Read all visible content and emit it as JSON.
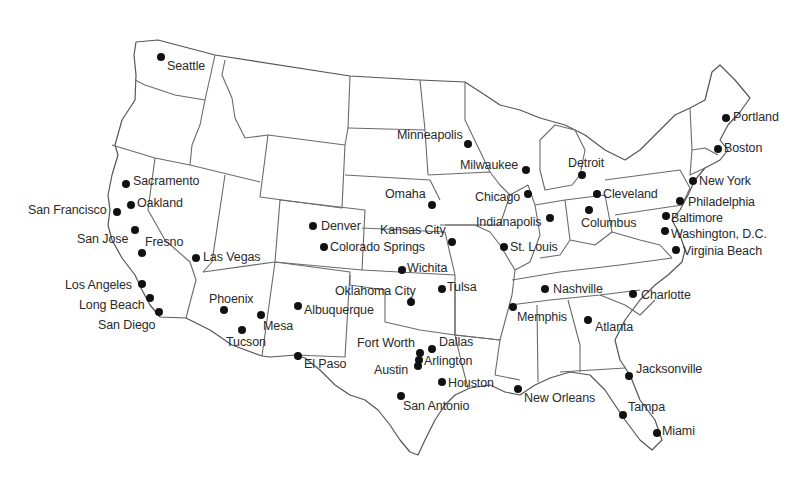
{
  "map": {
    "title": "Major U.S. Cities",
    "dot_color": "#111111",
    "border_color": "#6a6a6a",
    "cities": [
      {
        "name": "Seattle",
        "x": 161,
        "y": 57,
        "lx": 167,
        "ly": 60
      },
      {
        "name": "Portland",
        "x": 726,
        "y": 118,
        "lx": 733,
        "ly": 111
      },
      {
        "name": "Minneapolis",
        "x": 468,
        "y": 144,
        "lx": 397,
        "ly": 129
      },
      {
        "name": "Boston",
        "x": 718,
        "y": 149,
        "lx": 724,
        "ly": 142
      },
      {
        "name": "Milwaukee",
        "x": 526,
        "y": 170,
        "lx": 460,
        "ly": 159
      },
      {
        "name": "Detroit",
        "x": 582,
        "y": 175,
        "lx": 568,
        "ly": 157
      },
      {
        "name": "Sacramento",
        "x": 126,
        "y": 184,
        "lx": 133,
        "ly": 175
      },
      {
        "name": "New York",
        "x": 693,
        "y": 181,
        "lx": 699,
        "ly": 175
      },
      {
        "name": "Chicago",
        "x": 528,
        "y": 194,
        "lx": 475,
        "ly": 191
      },
      {
        "name": "Cleveland",
        "x": 597,
        "y": 194,
        "lx": 603,
        "ly": 188
      },
      {
        "name": "Omaha",
        "x": 432,
        "y": 205,
        "lx": 385,
        "ly": 188
      },
      {
        "name": "Philadelphia",
        "x": 680,
        "y": 201,
        "lx": 688,
        "ly": 196
      },
      {
        "name": "Oakland",
        "x": 131,
        "y": 205,
        "lx": 137,
        "ly": 197
      },
      {
        "name": "San Francisco",
        "x": 117,
        "y": 212,
        "lx": 28,
        "ly": 204
      },
      {
        "name": "Columbus",
        "x": 589,
        "y": 210,
        "lx": 581,
        "ly": 217
      },
      {
        "name": "Indianapolis",
        "x": 550,
        "y": 218,
        "lx": 476,
        "ly": 216
      },
      {
        "name": "Baltimore",
        "x": 666,
        "y": 216,
        "lx": 671,
        "ly": 212
      },
      {
        "name": "Denver",
        "x": 313,
        "y": 226,
        "lx": 321,
        "ly": 220
      },
      {
        "name": "Washington, D.C.",
        "x": 665,
        "y": 231,
        "lx": 671,
        "ly": 228
      },
      {
        "name": "San Jose",
        "x": 135,
        "y": 230,
        "lx": 77,
        "ly": 233
      },
      {
        "name": "Kansas City",
        "x": 452,
        "y": 242,
        "lx": 380,
        "ly": 224
      },
      {
        "name": "St. Louis",
        "x": 504,
        "y": 247,
        "lx": 510,
        "ly": 241
      },
      {
        "name": "Fresno",
        "x": 142,
        "y": 253,
        "lx": 145,
        "ly": 236
      },
      {
        "name": "Colorado Springs",
        "x": 324,
        "y": 247,
        "lx": 330,
        "ly": 241
      },
      {
        "name": "Virginia Beach",
        "x": 676,
        "y": 250,
        "lx": 683,
        "ly": 245
      },
      {
        "name": "Las Vegas",
        "x": 196,
        "y": 258,
        "lx": 203,
        "ly": 251
      },
      {
        "name": "Wichita",
        "x": 402,
        "y": 270,
        "lx": 407,
        "ly": 262
      },
      {
        "name": "Los Angeles",
        "x": 142,
        "y": 284,
        "lx": 65,
        "ly": 279
      },
      {
        "name": "Tulsa",
        "x": 442,
        "y": 289,
        "lx": 447,
        "ly": 281
      },
      {
        "name": "Nashville",
        "x": 545,
        "y": 289,
        "lx": 553,
        "ly": 283
      },
      {
        "name": "Oklahoma City",
        "x": 411,
        "y": 302,
        "lx": 335,
        "ly": 285
      },
      {
        "name": "Long Beach",
        "x": 150,
        "y": 298,
        "lx": 79,
        "ly": 299
      },
      {
        "name": "Charlotte",
        "x": 633,
        "y": 294,
        "lx": 641,
        "ly": 289
      },
      {
        "name": "Phoenix",
        "x": 224,
        "y": 310,
        "lx": 209,
        "ly": 293
      },
      {
        "name": "Albuquerque",
        "x": 298,
        "y": 306,
        "lx": 304,
        "ly": 304
      },
      {
        "name": "Memphis",
        "x": 513,
        "y": 307,
        "lx": 517,
        "ly": 311
      },
      {
        "name": "San Diego",
        "x": 159,
        "y": 312,
        "lx": 98,
        "ly": 319
      },
      {
        "name": "Mesa",
        "x": 261,
        "y": 315,
        "lx": 263,
        "ly": 320
      },
      {
        "name": "Atlanta",
        "x": 588,
        "y": 320,
        "lx": 595,
        "ly": 321
      },
      {
        "name": "Tucson",
        "x": 242,
        "y": 330,
        "lx": 226,
        "ly": 336
      },
      {
        "name": "Dallas",
        "x": 432,
        "y": 349,
        "lx": 439,
        "ly": 336
      },
      {
        "name": "Fort Worth",
        "x": 420,
        "y": 353,
        "lx": 357,
        "ly": 337
      },
      {
        "name": "Arlington",
        "x": 419,
        "y": 360,
        "lx": 424,
        "ly": 355
      },
      {
        "name": "Austin",
        "x": 418,
        "y": 366,
        "lx": 374,
        "ly": 364
      },
      {
        "name": "El Paso",
        "x": 298,
        "y": 356,
        "lx": 304,
        "ly": 358
      },
      {
        "name": "Jacksonville",
        "x": 629,
        "y": 376,
        "lx": 636,
        "ly": 363
      },
      {
        "name": "Houston",
        "x": 442,
        "y": 382,
        "lx": 448,
        "ly": 377
      },
      {
        "name": "New Orleans",
        "x": 518,
        "y": 389,
        "lx": 524,
        "ly": 392
      },
      {
        "name": "San Antonio",
        "x": 401,
        "y": 396,
        "lx": 403,
        "ly": 400
      },
      {
        "name": "Tampa",
        "x": 623,
        "y": 415,
        "lx": 628,
        "ly": 401
      },
      {
        "name": "Miami",
        "x": 657,
        "y": 433,
        "lx": 662,
        "ly": 425
      }
    ]
  }
}
